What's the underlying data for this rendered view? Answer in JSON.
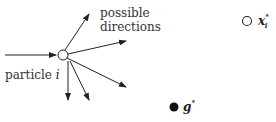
{
  "labels": {
    "particle": "particle",
    "particle_index": "i",
    "possible_line1": "possible",
    "possible_line2": "directions",
    "personal_best_symbol": "x",
    "personal_best_sub": "i",
    "personal_best_sup": "*",
    "global_best_symbol": "g",
    "global_best_sup": "*"
  },
  "colors": {
    "stroke": "#222222",
    "background": "#ffffff"
  }
}
